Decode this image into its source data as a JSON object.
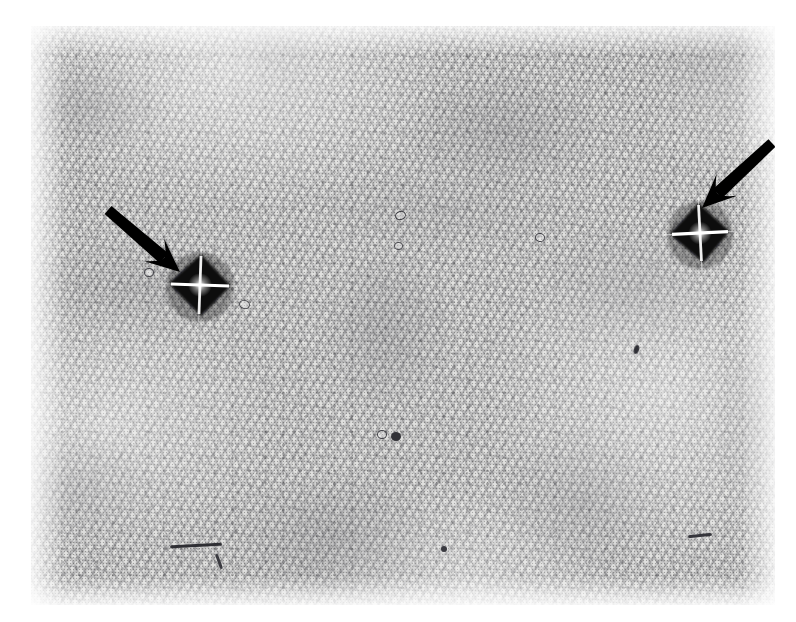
{
  "figure": {
    "kind": "optical-micrograph",
    "page_background": "#ffffff",
    "plate": {
      "x": 31,
      "y": 26,
      "width": 744,
      "height": 579,
      "base_tone": "#f3f3f1",
      "mid_tone": "#9a9aa0",
      "dark_tone": "#4a4a50"
    },
    "ink_color": "#000000",
    "caption": "",
    "scale_bar": "",
    "magnification": ""
  },
  "indentations": [
    {
      "label": "left-vickers-indent",
      "cx": 200,
      "cy": 285,
      "half_width": 30,
      "half_height": 31,
      "rotation_deg": 2,
      "fill": "#070708",
      "highlight": "#ffffff"
    },
    {
      "label": "right-vickers-indent",
      "cx": 700,
      "cy": 233,
      "half_width": 29,
      "half_height": 30,
      "rotation_deg": -3,
      "fill": "#070708",
      "highlight": "#ffffff"
    }
  ],
  "arrows": [
    {
      "label": "left-arrow",
      "tail_x": 108,
      "tail_y": 210,
      "tip_x": 180,
      "tip_y": 272,
      "shaft_width": 13,
      "head_length": 34,
      "head_width": 30,
      "color": "#000000"
    },
    {
      "label": "right-arrow",
      "tail_x": 772,
      "tail_y": 143,
      "tip_x": 702,
      "tip_y": 208,
      "shaft_width": 13,
      "head_length": 34,
      "head_width": 30,
      "color": "#000000"
    }
  ],
  "defects": [
    {
      "label": "pore-a",
      "x": 399,
      "y": 214,
      "w": 9,
      "h": 7,
      "rot": -20,
      "tone": "#3b3b40",
      "shape": "ring"
    },
    {
      "label": "pore-b",
      "x": 397,
      "y": 245,
      "w": 7,
      "h": 6,
      "rot": 0,
      "tone": "#4a4a4f",
      "shape": "ring"
    },
    {
      "label": "pore-c",
      "x": 539,
      "y": 236,
      "w": 8,
      "h": 7,
      "rot": 10,
      "tone": "#3f3f45",
      "shape": "ring"
    },
    {
      "label": "pore-d",
      "x": 148,
      "y": 271,
      "w": 8,
      "h": 7,
      "rot": 0,
      "tone": "#44444a",
      "shape": "ring"
    },
    {
      "label": "pore-e",
      "x": 243,
      "y": 303,
      "w": 9,
      "h": 7,
      "rot": 15,
      "tone": "#45454b",
      "shape": "ring"
    },
    {
      "label": "pore-f",
      "x": 381,
      "y": 433,
      "w": 8,
      "h": 7,
      "rot": 0,
      "tone": "#3d3d43",
      "shape": "ring"
    },
    {
      "label": "pore-g",
      "x": 396,
      "y": 436,
      "w": 10,
      "h": 9,
      "rot": 0,
      "tone": "#333338",
      "shape": "blob"
    },
    {
      "label": "pore-h",
      "x": 444,
      "y": 549,
      "w": 6,
      "h": 6,
      "rot": 0,
      "tone": "#3a3a40",
      "shape": "blob"
    },
    {
      "label": "scratch-long",
      "x": 196,
      "y": 545,
      "w": 52,
      "h": 3,
      "rot": -3,
      "tone": "#2e2e33",
      "shape": "streak"
    },
    {
      "label": "scratch-short",
      "x": 219,
      "y": 561,
      "w": 16,
      "h": 3,
      "rot": 70,
      "tone": "#3a3a40",
      "shape": "streak"
    },
    {
      "label": "scratch-right",
      "x": 700,
      "y": 535,
      "w": 24,
      "h": 3,
      "rot": -6,
      "tone": "#35353b",
      "shape": "streak"
    },
    {
      "label": "inclusion-right",
      "x": 636,
      "y": 349,
      "w": 5,
      "h": 9,
      "rot": 18,
      "tone": "#303036",
      "shape": "blob"
    }
  ]
}
